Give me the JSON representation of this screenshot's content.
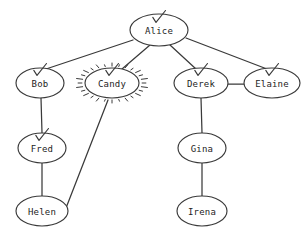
{
  "diagram": {
    "type": "node-link-graph",
    "background_color": "#ffffff",
    "stroke_color": "#3a3a3a",
    "label_color": "#1d1d1d",
    "node_shape": "ellipse",
    "node_fill": "#ffffff",
    "nodes": [
      {
        "id": "alice",
        "label": "Alice",
        "x": 159,
        "y": 30,
        "rx": 29,
        "ry": 16,
        "checked": true,
        "highlighted": false
      },
      {
        "id": "bob",
        "label": "Bob",
        "x": 40,
        "y": 83,
        "rx": 24,
        "ry": 15,
        "checked": true,
        "highlighted": false
      },
      {
        "id": "candy",
        "label": "Candy",
        "x": 112,
        "y": 83,
        "rx": 27,
        "ry": 15,
        "checked": true,
        "highlighted": true
      },
      {
        "id": "derek",
        "label": "Derek",
        "x": 201,
        "y": 83,
        "rx": 27,
        "ry": 15,
        "checked": true,
        "highlighted": false
      },
      {
        "id": "elaine",
        "label": "Elaine",
        "x": 272,
        "y": 83,
        "rx": 28,
        "ry": 15,
        "checked": true,
        "highlighted": false
      },
      {
        "id": "fred",
        "label": "Fred",
        "x": 42,
        "y": 148,
        "rx": 24,
        "ry": 15,
        "checked": true,
        "highlighted": false
      },
      {
        "id": "gina",
        "label": "Gina",
        "x": 202,
        "y": 148,
        "rx": 24,
        "ry": 15,
        "checked": false,
        "highlighted": false
      },
      {
        "id": "helen",
        "label": "Helen",
        "x": 42,
        "y": 211,
        "rx": 26,
        "ry": 15,
        "checked": false,
        "highlighted": false
      },
      {
        "id": "irena",
        "label": "Irena",
        "x": 202,
        "y": 211,
        "rx": 25,
        "ry": 15,
        "checked": false,
        "highlighted": false
      }
    ],
    "edges": [
      {
        "id": "alice-bob",
        "from": "alice",
        "to": "bob",
        "x1": 133,
        "y1": 40,
        "x2": 46,
        "y2": 69
      },
      {
        "id": "alice-candy",
        "from": "alice",
        "to": "candy",
        "x1": 150,
        "y1": 45,
        "x2": 122,
        "y2": 69
      },
      {
        "id": "alice-derek",
        "from": "alice",
        "to": "derek",
        "x1": 170,
        "y1": 45,
        "x2": 196,
        "y2": 69
      },
      {
        "id": "alice-elaine",
        "from": "alice",
        "to": "elaine",
        "x1": 186,
        "y1": 38,
        "x2": 267,
        "y2": 69
      },
      {
        "id": "derek-elaine",
        "from": "derek",
        "to": "elaine",
        "x1": 228,
        "y1": 84,
        "x2": 244,
        "y2": 84
      },
      {
        "id": "bob-fred",
        "from": "bob",
        "to": "fred",
        "x1": 41,
        "y1": 98,
        "x2": 42,
        "y2": 133
      },
      {
        "id": "fred-helen",
        "from": "fred",
        "to": "helen",
        "x1": 42,
        "y1": 163,
        "x2": 42,
        "y2": 196
      },
      {
        "id": "derek-gina",
        "from": "derek",
        "to": "gina",
        "x1": 201,
        "y1": 98,
        "x2": 202,
        "y2": 133
      },
      {
        "id": "gina-irena",
        "from": "gina",
        "to": "irena",
        "x1": 202,
        "y1": 163,
        "x2": 202,
        "y2": 196
      },
      {
        "id": "candy-helen",
        "from": "candy",
        "to": "helen",
        "x1": 108,
        "y1": 100,
        "x2": 66,
        "y2": 208
      }
    ],
    "markers": {
      "check_icon_name": "check-mark-icon",
      "highlight_icon_name": "starburst-highlight",
      "highlight_ray_count": 28,
      "checked_nodes": [
        "Alice",
        "Bob",
        "Candy",
        "Derek",
        "Elaine",
        "Fred"
      ],
      "highlighted_nodes": [
        "Candy"
      ],
      "unchecked_nodes": [
        "Helen",
        "Gina",
        "Irena"
      ]
    }
  }
}
